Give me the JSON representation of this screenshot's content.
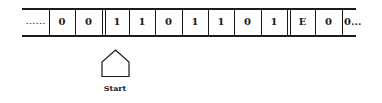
{
  "diagram": {
    "type": "turing-machine-tape",
    "left_ellipsis": "……",
    "cells": [
      {
        "value": "0"
      },
      {
        "value": "0"
      },
      {
        "value": "1"
      },
      {
        "value": "1"
      },
      {
        "value": "0"
      },
      {
        "value": "1"
      },
      {
        "value": "1"
      },
      {
        "value": "0"
      },
      {
        "value": "1"
      },
      {
        "value": "E"
      },
      {
        "value": "0"
      },
      {
        "value": "0..."
      }
    ],
    "head": {
      "label": "Start",
      "position_cell_index": 2
    },
    "colors": {
      "line": "#1a1a1a",
      "background": "#ffffff"
    }
  }
}
